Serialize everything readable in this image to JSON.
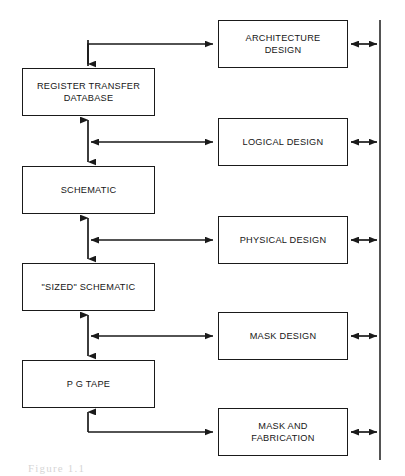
{
  "figure": {
    "type": "block-flow-diagram",
    "caption": "Figure 1.1",
    "background_color": "#ffffff",
    "line_color": "#1a1a1a",
    "text_color": "#161616"
  },
  "left_column": {
    "title": "Design database representations",
    "boxes": [
      {
        "id": "register-transfer-database",
        "label": "REGISTER TRANSFER\nDATABASE",
        "x": 22,
        "y": 68,
        "w": 133,
        "h": 48
      },
      {
        "id": "schematic",
        "label": "SCHEMATIC",
        "x": 22,
        "y": 166,
        "w": 133,
        "h": 48
      },
      {
        "id": "sized-schematic",
        "label": "\"SIZED\" SCHEMATIC",
        "x": 22,
        "y": 263,
        "w": 133,
        "h": 48
      },
      {
        "id": "pg-tape",
        "label": "P G TAPE",
        "x": 22,
        "y": 360,
        "w": 133,
        "h": 48
      }
    ]
  },
  "right_column": {
    "title": "Design activities",
    "boxes": [
      {
        "id": "architecture-design",
        "label": "ARCHITECTURE\nDESIGN",
        "x": 218,
        "y": 20,
        "w": 130,
        "h": 48
      },
      {
        "id": "logical-design",
        "label": "LOGICAL DESIGN",
        "x": 218,
        "y": 118,
        "w": 130,
        "h": 48
      },
      {
        "id": "physical-design",
        "label": "PHYSICAL DESIGN",
        "x": 218,
        "y": 216,
        "w": 130,
        "h": 48
      },
      {
        "id": "mask-design",
        "label": "MASK DESIGN",
        "x": 218,
        "y": 312,
        "w": 130,
        "h": 48
      },
      {
        "id": "mask-and-fabrication",
        "label": "MASK AND\nFABRICATION",
        "x": 218,
        "y": 408,
        "w": 130,
        "h": 48
      }
    ]
  },
  "bus": {
    "id": "vertical-bus-line",
    "x": 380,
    "y_top": 20,
    "y_bottom": 460,
    "connector_count": 5,
    "connector_y": [
      44,
      142,
      240,
      336,
      432
    ]
  },
  "connectors": {
    "spine_x": 88,
    "top_elbow": {
      "id": "architecture-to-database",
      "from": "architecture-design",
      "to": "register-transfer-database",
      "kind": "elbow-arrow",
      "y": 44
    },
    "bidirectional_pairs": [
      {
        "id": "database-schematic-logical",
        "vertical_between": [
          "register-transfer-database",
          "schematic"
        ],
        "horizontal_to": "logical-design",
        "y": 142
      },
      {
        "id": "schematic-sized-physical",
        "vertical_between": [
          "schematic",
          "sized-schematic"
        ],
        "horizontal_to": "physical-design",
        "y": 240
      },
      {
        "id": "sized-pgtape-mask",
        "vertical_between": [
          "sized-schematic",
          "pg-tape"
        ],
        "horizontal_to": "mask-design",
        "y": 336
      }
    ],
    "bottom_elbow": {
      "id": "fabrication-to-pgtape",
      "from": "pg-tape",
      "to": "mask-and-fabrication",
      "kind": "elbow-arrow",
      "y": 432
    }
  }
}
